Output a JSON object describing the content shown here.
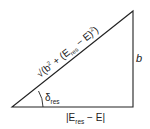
{
  "diagram": {
    "type": "right-triangle",
    "hypotenuse_label": {
      "prefix": "√(b",
      "sup1": "2",
      "mid": " + (E",
      "sub": "res",
      "mid2": " − E)",
      "sup2": "2",
      "suffix": ")"
    },
    "vertical_side_label": "b",
    "base_label": {
      "prefix": "|E",
      "sub": "res",
      "suffix": " − E|"
    },
    "angle_label": {
      "symbol": "δ",
      "sub": "res"
    },
    "colors": {
      "stroke": "#222222",
      "background": "#ffffff"
    }
  }
}
